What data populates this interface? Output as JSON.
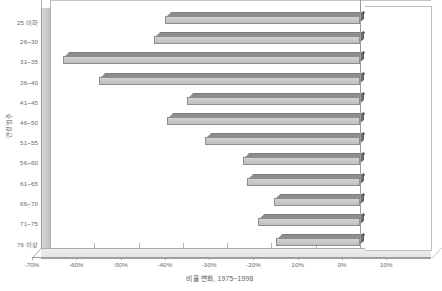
{
  "chart_data": {
    "type": "bar",
    "orientation": "horizontal",
    "title": "",
    "xlabel": "비율 변화, 1975~1998",
    "ylabel": "연령 범주",
    "categories": [
      "25 이하",
      "26~30",
      "31~35",
      "36~40",
      "41~45",
      "46~50",
      "51~55",
      "56~60",
      "61~65",
      "66~70",
      "71~75",
      "76 이상"
    ],
    "values": [
      -44.0,
      -46.5,
      -67.0,
      -59.0,
      -39.0,
      -43.5,
      -35.0,
      -26.5,
      -25.5,
      -19.5,
      -23.0,
      -19.0
    ],
    "xlim": [
      -70,
      10
    ],
    "xtick_values": [
      -70,
      -60,
      -50,
      -40,
      -30,
      -20,
      -10,
      0,
      10
    ],
    "xtick_labels": [
      "-70%",
      "-60%",
      "-50%",
      "-40%",
      "-30%",
      "-20%",
      "10%",
      "0%",
      "10%"
    ],
    "grid": false,
    "legend": "none",
    "secondary_axis": {
      "name": "birth-year",
      "labels": [
        "1975",
        "1965",
        "1955",
        "1945",
        "1935",
        "1925"
      ],
      "maps_to_categories": [
        "26~30",
        "36~40",
        "46~50",
        "56~60",
        "66~70",
        "76 이상"
      ]
    },
    "series": [
      {
        "name": "비율 변화 1975~1998",
        "values": [
          -44.0,
          -46.5,
          -67.0,
          -59.0,
          -39.0,
          -43.5,
          -35.0,
          -26.5,
          -25.5,
          -19.5,
          -23.0,
          -19.0
        ]
      }
    ],
    "colors": {
      "bar_face": "#c9c9c9",
      "bar_top": "#8d8d8d",
      "bar_cap": "#6f6f6f",
      "axis": "#9e9e9e",
      "text": "#6a6a6a"
    }
  },
  "header": {
    "right_caption": ""
  }
}
